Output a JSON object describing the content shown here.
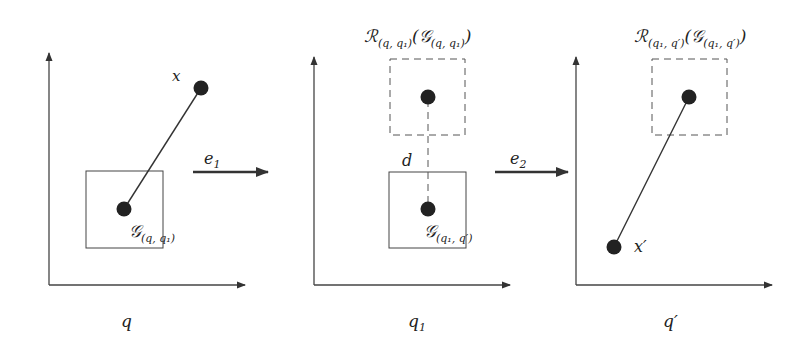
{
  "diagram": {
    "colors": {
      "line": "#333333",
      "dot": "#222222",
      "background": "#ffffff"
    },
    "panels": [
      {
        "id": "panel-q",
        "axis_label": "q",
        "point_label": "x",
        "box_label_main": "𝒢",
        "box_label_sub": "(q, q₁)"
      },
      {
        "id": "panel-q1",
        "axis_label_main": "q",
        "axis_label_sub": "1",
        "distance_label": "d",
        "top_label_R": "ℛ",
        "top_label_R_sub": "(q, q₁)",
        "top_label_G": "(𝒢",
        "top_label_G_sub": "(q, q₁)",
        "top_label_close": ")",
        "box_label_main": "𝒢",
        "box_label_sub": "(q₁, q′)"
      },
      {
        "id": "panel-qprime",
        "axis_label": "q′",
        "point_label": "x′",
        "top_label_R": "ℛ",
        "top_label_R_sub": "(q₁, q′)",
        "top_label_G": "(𝒢",
        "top_label_G_sub": "(q₁, q′)",
        "top_label_close": ")"
      }
    ],
    "transitions": [
      {
        "label_main": "e",
        "label_sub": "1"
      },
      {
        "label_main": "e",
        "label_sub": "2"
      }
    ]
  }
}
